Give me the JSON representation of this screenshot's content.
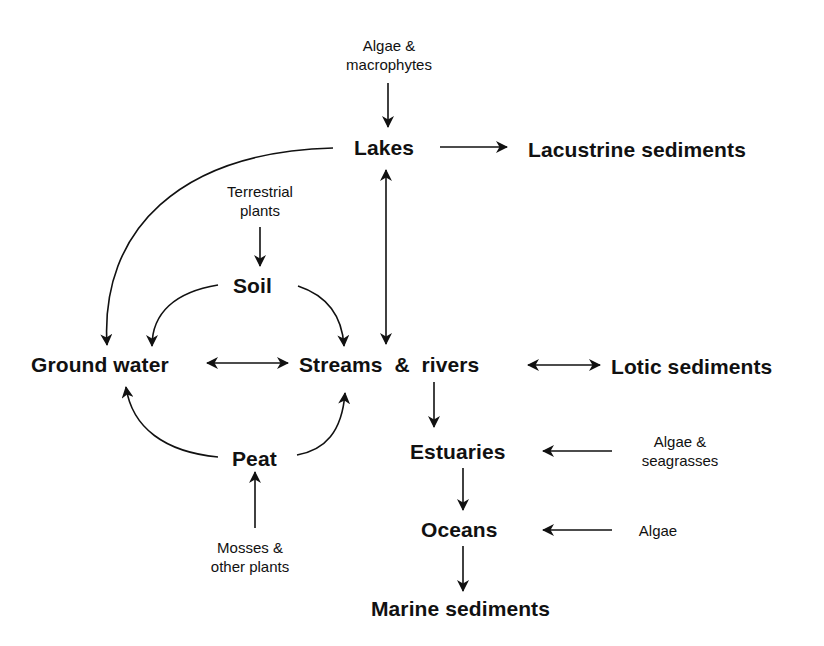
{
  "diagram": {
    "title": "",
    "colors": {
      "background": "#ffffff",
      "ink": "#111111"
    },
    "nodes": {
      "lakes": "Lakes",
      "lacustrine_sediments": "Lacustrine sediments",
      "soil": "Soil",
      "ground_water": "Ground water",
      "streams_rivers": "Streams  &  rivers",
      "lotic_sediments": "Lotic sediments",
      "peat": "Peat",
      "estuaries": "Estuaries",
      "oceans": "Oceans",
      "marine_sediments": "Marine sediments"
    },
    "sources": {
      "lakes_source": {
        "line1": "Algae &",
        "line2": "macrophytes"
      },
      "soil_source": {
        "line1": "Terrestrial",
        "line2": "plants"
      },
      "peat_source": {
        "line1": "Mosses &",
        "line2": "other plants"
      },
      "estuaries_source": {
        "line1": "Algae &",
        "line2": "seagrasses"
      },
      "oceans_source": {
        "line1": "Algae"
      }
    },
    "edges": [
      {
        "from": "Algae & macrophytes",
        "to": "Lakes",
        "type": "one-way"
      },
      {
        "from": "Lakes",
        "to": "Lacustrine sediments",
        "type": "one-way"
      },
      {
        "from": "Lakes",
        "to": "Ground water",
        "type": "one-way"
      },
      {
        "from": "Lakes",
        "to": "Streams & rivers",
        "type": "two-way"
      },
      {
        "from": "Terrestrial plants",
        "to": "Soil",
        "type": "one-way"
      },
      {
        "from": "Soil",
        "to": "Ground water",
        "type": "one-way"
      },
      {
        "from": "Soil",
        "to": "Streams & rivers",
        "type": "one-way"
      },
      {
        "from": "Ground water",
        "to": "Streams & rivers",
        "type": "two-way"
      },
      {
        "from": "Streams & rivers",
        "to": "Lotic sediments",
        "type": "two-way"
      },
      {
        "from": "Peat",
        "to": "Ground water",
        "type": "one-way"
      },
      {
        "from": "Peat",
        "to": "Streams & rivers",
        "type": "one-way"
      },
      {
        "from": "Mosses & other plants",
        "to": "Peat",
        "type": "one-way"
      },
      {
        "from": "Streams & rivers",
        "to": "Estuaries",
        "type": "one-way"
      },
      {
        "from": "Algae & seagrasses",
        "to": "Estuaries",
        "type": "one-way"
      },
      {
        "from": "Estuaries",
        "to": "Oceans",
        "type": "one-way"
      },
      {
        "from": "Algae",
        "to": "Oceans",
        "type": "one-way"
      },
      {
        "from": "Oceans",
        "to": "Marine sediments",
        "type": "one-way"
      }
    ]
  }
}
